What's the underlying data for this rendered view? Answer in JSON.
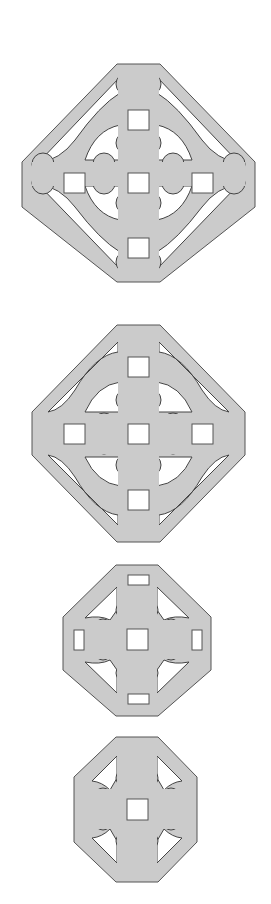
{
  "figure": {
    "colors": {
      "fill": "#cbcbcb",
      "outline": "#555555",
      "background": "#ffffff",
      "cutout": "#ffffff"
    },
    "tiles": [
      {
        "id": 1,
        "label": "tile-large-ring",
        "square_holes": 5,
        "has_ring": true
      },
      {
        "id": 2,
        "label": "tile-ring-tight",
        "square_holes": 5,
        "has_ring": true
      },
      {
        "id": 3,
        "label": "tile-medium",
        "square_holes": 1,
        "rect_holes": 4,
        "has_ring": false
      },
      {
        "id": 4,
        "label": "tile-small",
        "square_holes": 1,
        "has_ring": false
      }
    ]
  }
}
